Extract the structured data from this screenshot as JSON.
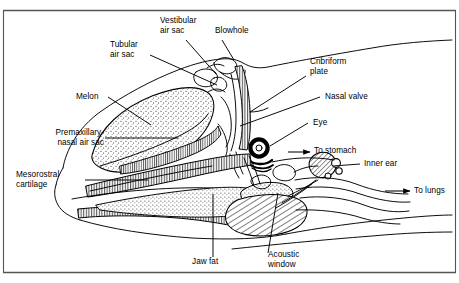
{
  "figure": {
    "frame_color": "#555555",
    "ink_color": "#000000",
    "background": "#ffffff"
  },
  "labels": {
    "vestibular_air_sac": "Vestibular\nair sac",
    "blowhole": "Blowhole",
    "tubular_air_sac": "Tubular\nair sac",
    "cribriform_plate": "Cribriform\nplate",
    "nasal_valve": "Nasal valve",
    "melon": "Melon",
    "eye": "Eye",
    "premaxillary_nasal_air_sac": "Premaxillary-\nnasal air sac",
    "to_stomach": "To stomach",
    "inner_ear": "Inner ear",
    "mesorostral_cartilage": "Mesorostral\ncartilage",
    "to_lungs": "To lungs",
    "jaw_fat": "Jaw fat",
    "acoustic_window": "Acoustic\nwindow"
  },
  "structures": [
    {
      "name": "melon",
      "texture": "stipple"
    },
    {
      "name": "premaxillary-nasal-air-sac",
      "texture": "vertical-hatch"
    },
    {
      "name": "mesorostral-cartilage",
      "texture": "vertical-hatch"
    },
    {
      "name": "rostrum-bone",
      "texture": "vertical-hatch"
    },
    {
      "name": "jaw-fat",
      "texture": "stipple"
    },
    {
      "name": "acoustic-window",
      "texture": "stipple"
    },
    {
      "name": "tympano-periotic-bone",
      "texture": "diagonal-hatch"
    },
    {
      "name": "inner-ear",
      "texture": "diagonal-hatch"
    },
    {
      "name": "nasal-passage",
      "texture": "vertical-hatch"
    },
    {
      "name": "eye",
      "texture": "solid-ring"
    },
    {
      "name": "blowhole",
      "texture": "outline"
    }
  ],
  "arrows": [
    "to-stomach",
    "to-lungs"
  ]
}
